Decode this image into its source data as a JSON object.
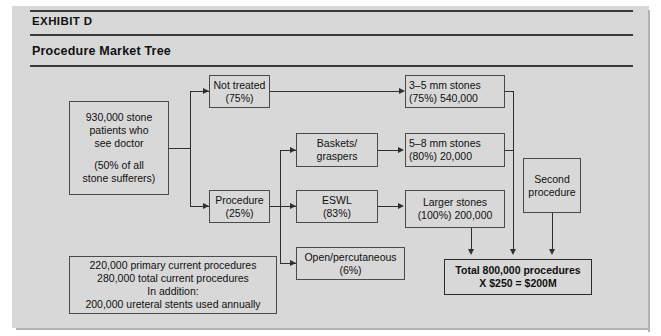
{
  "exhibit": {
    "label": "EXHIBIT D",
    "title": "Procedure Market Tree"
  },
  "nodes": {
    "stone_patients": {
      "line1": "930,000 stone",
      "line2": "patients who",
      "line3": "see doctor",
      "line4": "(50% of all",
      "line5": "stone sufferers)"
    },
    "not_treated": {
      "line1": "Not treated",
      "line2": "(75%)"
    },
    "procedure": {
      "line1": "Procedure",
      "line2": "(25%)"
    },
    "baskets": {
      "line1": "Baskets/",
      "line2": "graspers"
    },
    "eswl": {
      "line1": "ESWL",
      "line2": "(83%)"
    },
    "open_perc": {
      "line1": "Open/percutaneous",
      "line2": "(6%)"
    },
    "stones_3_5": {
      "line1": "3–5 mm stones",
      "line2": "(75%) 540,000"
    },
    "stones_5_8": {
      "line1": "5–8 mm stones",
      "line2": "(80%) 20,000"
    },
    "stones_larger": {
      "line1": "Larger stones",
      "line2": "(100%) 200,000"
    },
    "second_procedure": {
      "line1": "Second",
      "line2": "procedure"
    },
    "total": {
      "line1": "Total 800,000 procedures",
      "line2": "X $250 = $200M"
    },
    "footnote": {
      "line1": "220,000 primary current procedures",
      "line2": "280,000 total current procedures",
      "line3": "In addition:",
      "line4": "200,000 ureteral stents used annually"
    }
  },
  "colors": {
    "panel_background": "#d8d8d8",
    "page_background": "#ffffff",
    "line": "#2f2f2f",
    "box_border": "#4a4a4a",
    "text": "#101010",
    "rule": "#3a3a3a"
  }
}
